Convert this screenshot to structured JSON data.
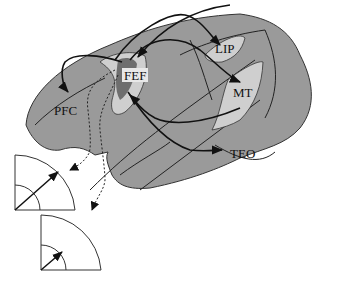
{
  "diagram": {
    "colors": {
      "cortex": "#9a9a9a",
      "area_fill": "#c9c9c9",
      "fef_dark": "#6e6e6e",
      "outline": "#333333",
      "arrow": "#111111",
      "background": "#ffffff"
    },
    "areas": [
      {
        "id": "pfc",
        "label": "PFC"
      },
      {
        "id": "fef",
        "label": "FEF"
      },
      {
        "id": "lip",
        "label": "LIP"
      },
      {
        "id": "mt",
        "label": "MT"
      },
      {
        "id": "teo",
        "label": "TEO"
      }
    ],
    "connections": [
      {
        "from": "FEF",
        "to": "PFC",
        "style": "solid"
      },
      {
        "from": "FEF",
        "to": "LIP",
        "style": "solid"
      },
      {
        "from": "LIP",
        "to": "FEF",
        "style": "solid"
      },
      {
        "from": "FEF",
        "to": "MT",
        "style": "solid"
      },
      {
        "from": "MT",
        "to": "FEF",
        "style": "solid"
      },
      {
        "from": "FEF",
        "to": "TEO",
        "style": "solid"
      },
      {
        "from": "FEF",
        "to": "visual-field-1",
        "style": "dotted"
      },
      {
        "from": "FEF",
        "to": "visual-field-2",
        "style": "dotted"
      }
    ],
    "visual_fields": [
      {
        "id": "visual-field-1",
        "description": "Quarter-circle visual field with long vector to outer ring"
      },
      {
        "id": "visual-field-2",
        "description": "Quarter-circle visual field with short vector to inner ring"
      }
    ]
  }
}
